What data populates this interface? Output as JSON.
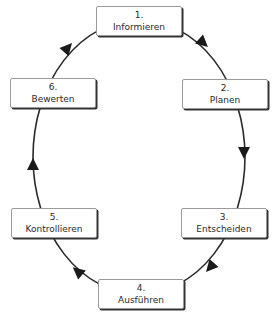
{
  "diagram": {
    "type": "cycle",
    "direction": "clockwise",
    "line_color": "#2a2a2a",
    "box_shadow_color": "#333333",
    "steps": [
      {
        "number": "1.",
        "label": "Informieren",
        "x": 96,
        "y": 6
      },
      {
        "number": "2.",
        "label": "Planen",
        "x": 182,
        "y": 79
      },
      {
        "number": "3.",
        "label": "Entscheiden",
        "x": 181,
        "y": 208
      },
      {
        "number": "4.",
        "label": "Ausführen",
        "x": 98,
        "y": 279
      },
      {
        "number": "5.",
        "label": "Kontrollieren",
        "x": 11,
        "y": 208
      },
      {
        "number": "6.",
        "label": "Bewerten",
        "x": 10,
        "y": 78
      }
    ],
    "edges": [
      {
        "from": "1. Informieren",
        "to": "2. Planen"
      },
      {
        "from": "2. Planen",
        "to": "3. Entscheiden"
      },
      {
        "from": "3. Entscheiden",
        "to": "4. Ausführen"
      },
      {
        "from": "4. Ausführen",
        "to": "5. Kontrollieren"
      },
      {
        "from": "5. Kontrollieren",
        "to": "6. Bewerten"
      },
      {
        "from": "6. Bewerten",
        "to": "1. Informieren"
      }
    ]
  }
}
